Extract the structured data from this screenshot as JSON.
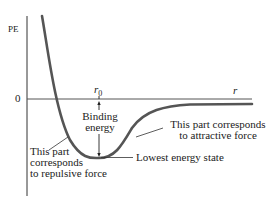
{
  "diagram": {
    "y_axis_label": "PE",
    "x_axis_label": "r",
    "zero_label": "0",
    "r0_label": "r",
    "r0_subscript": "0",
    "annotations": {
      "binding_energy_line1": "Binding",
      "binding_energy_line2": "energy",
      "attractive_line1": "This part corresponds",
      "attractive_line2": "to attractive force",
      "repulsive_line1": "This part",
      "repulsive_line2": "corresponds",
      "repulsive_line3": "to repulsive force",
      "lowest_state": "Lowest energy state"
    },
    "colors": {
      "curve": "#555555",
      "axis": "#333333",
      "text": "#222222"
    }
  }
}
